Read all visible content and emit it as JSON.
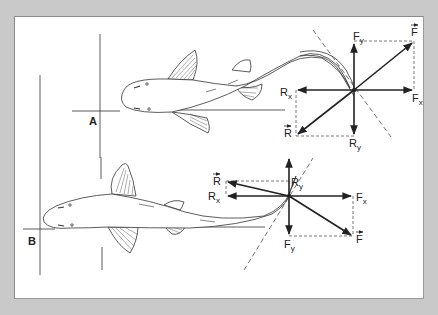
{
  "figure": {
    "panels": [
      {
        "id": "A",
        "label": "A",
        "vectors": {
          "F": "F",
          "Fx": "F",
          "Fx_sub": "x",
          "Fy": "F",
          "Fy_sub": "y",
          "R": "R",
          "Rx": "R",
          "Rx_sub": "x",
          "Ry": "R",
          "Ry_sub": "y"
        }
      },
      {
        "id": "B",
        "label": "B",
        "vectors": {
          "F": "F",
          "Fx": "F",
          "Fx_sub": "x",
          "Fy": "F",
          "Fy_sub": "y",
          "R": "R",
          "Rx": "R",
          "Rx_sub": "x",
          "Ry": "R",
          "Ry_sub": "y"
        }
      }
    ],
    "colors": {
      "frame": "#c9c9c9",
      "panel": "#ffffff",
      "ink": "#222222"
    }
  }
}
